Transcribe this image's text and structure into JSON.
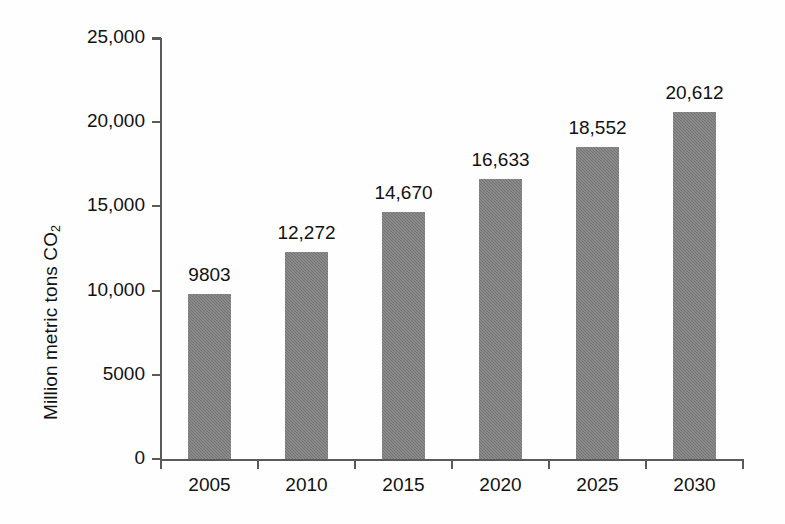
{
  "chart_data": {
    "type": "bar",
    "title": "",
    "subtitle": "",
    "xlabel": "",
    "ylabel": "Million metric tons CO2",
    "ylabel_parts": {
      "text": "Million metric tons CO",
      "subscript": "2"
    },
    "categories": [
      "2005",
      "2010",
      "2015",
      "2020",
      "2025",
      "2030"
    ],
    "values": [
      9803,
      12272,
      14670,
      16633,
      18552,
      20612
    ],
    "data_labels": [
      "9803",
      "12,272",
      "14,670",
      "16,633",
      "18,552",
      "20,612"
    ],
    "ylim": [
      0,
      25000
    ],
    "ytick_values": [
      0,
      5000,
      10000,
      15000,
      20000,
      25000
    ],
    "ytick_labels": [
      "0",
      "5000",
      "10,000",
      "15,000",
      "20,000",
      "25,000"
    ],
    "grid": false,
    "legend": null,
    "series": [
      {
        "name": "CO2 emissions",
        "values": [
          9803,
          12272,
          14670,
          16633,
          18552,
          20612
        ]
      }
    ]
  },
  "style": {
    "bar_color": "#7b7b7b",
    "axis_color": "#5a5a5a",
    "text_color": "#121212",
    "background": "#fefefe"
  }
}
